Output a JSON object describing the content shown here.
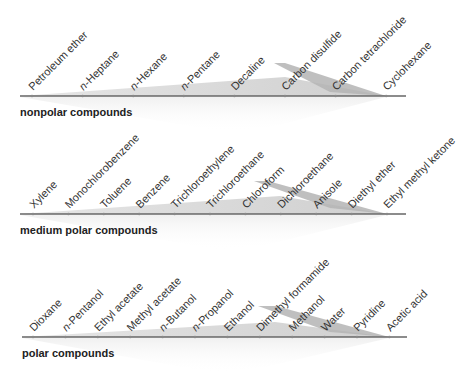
{
  "groups": [
    {
      "name": "nonpolar compounds",
      "axis_y": 96,
      "x_start": 20,
      "x_end": 406,
      "tick_start": 32,
      "tick_step": 50.6,
      "light_wedge": [
        [
          20,
          96
        ],
        [
          285,
          77
        ],
        [
          386,
          96
        ]
      ],
      "dark_wedge": [
        [
          274,
          63
        ],
        [
          285,
          63
        ],
        [
          386,
          96
        ],
        [
          330,
          92
        ]
      ],
      "solvents": [
        {
          "label": "Petroleum ether",
          "italic_prefix": ""
        },
        {
          "label": "-Heptane",
          "italic_prefix": "n"
        },
        {
          "label": "-Hexane",
          "italic_prefix": "n"
        },
        {
          "label": "-Pentane",
          "italic_prefix": "n"
        },
        {
          "label": "Decaline",
          "italic_prefix": ""
        },
        {
          "label": "Carbon disulfide",
          "italic_prefix": ""
        },
        {
          "label": "Carbon tetrachloride",
          "italic_prefix": ""
        },
        {
          "label": "Cyclohexane",
          "italic_prefix": ""
        }
      ]
    },
    {
      "name": "medium polar compounds",
      "axis_y": 214,
      "x_start": 20,
      "x_end": 406,
      "tick_start": 33,
      "tick_step": 35.4,
      "light_wedge": [
        [
          20,
          214
        ],
        [
          280,
          196
        ],
        [
          387,
          214
        ]
      ],
      "dark_wedge": [
        [
          254,
          181
        ],
        [
          268,
          181
        ],
        [
          387,
          214
        ],
        [
          330,
          208
        ]
      ],
      "solvents": [
        {
          "label": "Xylene",
          "italic_prefix": ""
        },
        {
          "label": "Monochlorobenzene",
          "italic_prefix": ""
        },
        {
          "label": "Toluene",
          "italic_prefix": ""
        },
        {
          "label": "Benzene",
          "italic_prefix": ""
        },
        {
          "label": "Trichloroethylene",
          "italic_prefix": ""
        },
        {
          "label": "Trichloroethane",
          "italic_prefix": ""
        },
        {
          "label": "Chloroform",
          "italic_prefix": ""
        },
        {
          "label": "Dichloroethane",
          "italic_prefix": ""
        },
        {
          "label": "Anisole",
          "italic_prefix": ""
        },
        {
          "label": "Diethyl ether",
          "italic_prefix": ""
        },
        {
          "label": "Ethyl methyl ketone",
          "italic_prefix": ""
        }
      ]
    },
    {
      "name": "polar compounds",
      "axis_y": 337,
      "x_start": 22,
      "x_end": 407,
      "tick_start": 33,
      "tick_step": 32.4,
      "light_wedge": [
        [
          22,
          337
        ],
        [
          275,
          322
        ],
        [
          389,
          337
        ]
      ],
      "dark_wedge": [
        [
          258,
          306
        ],
        [
          276,
          306
        ],
        [
          389,
          337
        ],
        [
          330,
          332
        ]
      ],
      "solvents": [
        {
          "label": "Dioxane",
          "italic_prefix": ""
        },
        {
          "label": "-Pentanol",
          "italic_prefix": "n"
        },
        {
          "label": "Ethyl acetate",
          "italic_prefix": ""
        },
        {
          "label": "Methyl acetate",
          "italic_prefix": ""
        },
        {
          "label": "-Butanol",
          "italic_prefix": "n"
        },
        {
          "label": "-Propanol",
          "italic_prefix": "n"
        },
        {
          "label": "Ethanol",
          "italic_prefix": ""
        },
        {
          "label": "Dimethyl formamide",
          "italic_prefix": ""
        },
        {
          "label": "Methanol",
          "italic_prefix": ""
        },
        {
          "label": "Water",
          "italic_prefix": ""
        },
        {
          "label": "Pyridine",
          "italic_prefix": ""
        },
        {
          "label": "Acetic acid",
          "italic_prefix": ""
        }
      ]
    }
  ],
  "colors": {
    "axis": "#666666",
    "tick": "#888888",
    "light_wedge": "#dcdcdc",
    "dark_wedge": "#b4b4b4",
    "reflection": "#f2f2f2",
    "text": "#333333"
  }
}
